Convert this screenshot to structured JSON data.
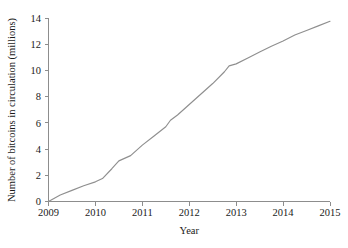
{
  "chart_data": {
    "type": "line",
    "title": "",
    "xlabel": "Year",
    "ylabel": "Number of bitcoins in circulation (millions)",
    "xlim": [
      2009,
      2015
    ],
    "ylim": [
      0,
      14
    ],
    "xticks": [
      "2009",
      "2010",
      "2011",
      "2012",
      "2013",
      "2014",
      "2015"
    ],
    "yticks": [
      "0",
      "2",
      "4",
      "6",
      "8",
      "10",
      "12",
      "14"
    ],
    "grid": false,
    "legend": false,
    "line_color": "#8f8f8f",
    "axis_color": "#8d8d8d",
    "background_color": "#ffffff",
    "series": [
      {
        "name": "Bitcoins in circulation",
        "x": [
          2009.0,
          2009.25,
          2009.5,
          2009.75,
          2010.0,
          2010.15,
          2010.35,
          2010.5,
          2010.75,
          2011.0,
          2011.25,
          2011.5,
          2011.6,
          2011.75,
          2012.0,
          2012.25,
          2012.5,
          2012.75,
          2012.85,
          2013.0,
          2013.25,
          2013.5,
          2013.75,
          2014.0,
          2014.25,
          2014.5,
          2014.75,
          2015.0
        ],
        "values": [
          0.0,
          0.5,
          0.85,
          1.2,
          1.5,
          1.75,
          2.5,
          3.1,
          3.5,
          4.3,
          5.0,
          5.7,
          6.2,
          6.6,
          7.4,
          8.2,
          9.0,
          9.9,
          10.35,
          10.5,
          10.95,
          11.4,
          11.85,
          12.25,
          12.7,
          13.05,
          13.4,
          13.75
        ]
      }
    ]
  }
}
